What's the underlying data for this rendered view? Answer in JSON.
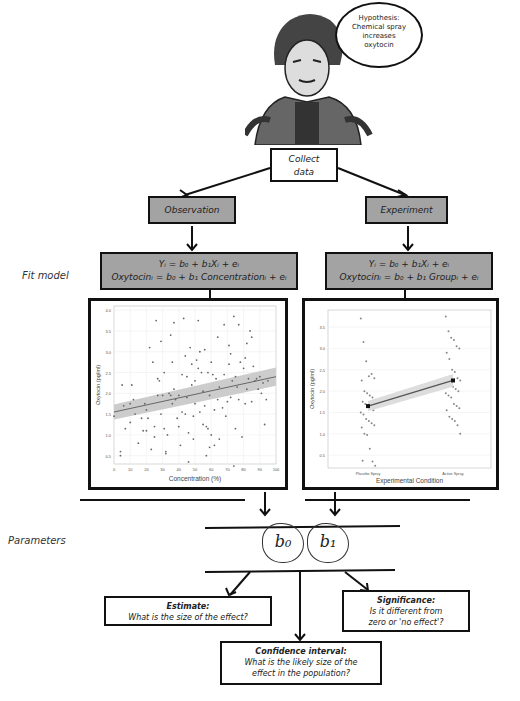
{
  "speech_bubble": {
    "lines": [
      "Hypothesis:",
      "Chemical spray",
      "increases",
      "oxytocin"
    ]
  },
  "collect_box": {
    "lines": [
      "Collect",
      "data"
    ]
  },
  "side_labels": {
    "fit_model": "Fit model",
    "parameters": "Parameters"
  },
  "branches": {
    "observation": {
      "label": "Observation",
      "eq1": "Yᵢ = b₀ + b₁Xᵢ + eᵢ",
      "eq2": "Oxytocinᵢ = b₀ + b₁ Concentrationᵢ + eᵢ"
    },
    "experiment": {
      "label": "Experiment",
      "eq1": "Yᵢ = b₀ + b₁Xᵢ + eᵢ",
      "eq2": "Oxytocinᵢ = b₀ + b₁ Groupᵢ + eᵢ"
    }
  },
  "parameters": {
    "b0": "b₀",
    "b1": "b₁"
  },
  "questions": {
    "estimate": {
      "title": "Estimate:",
      "text": "What is the size of the effect?"
    },
    "significance": {
      "title": "Significance:",
      "line1": "Is it different from",
      "line2": "zero or 'no effect'?"
    },
    "confidence": {
      "title": "Confidence interval:",
      "line1": "What is the likely size of the",
      "line2": "effect in the population?"
    }
  },
  "chart_data": [
    {
      "type": "scatter",
      "title": "",
      "xlabel": "Concentration (%)",
      "ylabel": "Oxytocin (pg/ml)",
      "xlim": [
        0,
        100
      ],
      "ylim": [
        0.3,
        4.1
      ],
      "xticks": [
        0,
        10,
        20,
        30,
        40,
        50,
        60,
        70,
        80,
        90,
        100
      ],
      "yticks": [
        0.5,
        1.0,
        1.5,
        2.0,
        2.5,
        3.0,
        3.5,
        4.0
      ],
      "grid": true,
      "regression": {
        "x": [
          0,
          100
        ],
        "y": [
          1.55,
          2.4
        ],
        "ci_band": true
      },
      "points": [
        [
          0,
          1.45
        ],
        [
          4,
          0.5
        ],
        [
          4,
          0.6
        ],
        [
          5,
          2.2
        ],
        [
          6,
          1.7
        ],
        [
          7,
          1.15
        ],
        [
          10,
          1.3
        ],
        [
          10,
          1.75
        ],
        [
          11,
          2.2
        ],
        [
          12,
          1.85
        ],
        [
          13,
          1.5
        ],
        [
          15,
          0.8
        ],
        [
          17,
          1.4
        ],
        [
          18,
          1.1
        ],
        [
          19,
          1.75
        ],
        [
          20,
          1.6
        ],
        [
          20,
          1.1
        ],
        [
          21,
          1.4
        ],
        [
          22,
          3.1
        ],
        [
          23,
          0.65
        ],
        [
          24,
          2.75
        ],
        [
          25,
          1.2
        ],
        [
          25,
          0.95
        ],
        [
          26,
          3.75
        ],
        [
          27,
          2.35
        ],
        [
          27,
          1.95
        ],
        [
          28,
          2.3
        ],
        [
          29,
          1.5
        ],
        [
          29,
          3.25
        ],
        [
          30,
          1.95
        ],
        [
          31,
          1.15
        ],
        [
          31,
          2.5
        ],
        [
          32,
          0.6
        ],
        [
          32,
          0.55
        ],
        [
          33,
          1.0
        ],
        [
          34,
          2.0
        ],
        [
          35,
          3.4
        ],
        [
          35,
          1.95
        ],
        [
          36,
          2.75
        ],
        [
          36,
          1.75
        ],
        [
          37,
          3.7
        ],
        [
          37,
          2.1
        ],
        [
          38,
          1.85
        ],
        [
          39,
          1.4
        ],
        [
          40,
          1.95
        ],
        [
          40,
          1.2
        ],
        [
          41,
          0.75
        ],
        [
          42,
          2.45
        ],
        [
          42,
          1.55
        ],
        [
          43,
          3.8
        ],
        [
          44,
          1.5
        ],
        [
          44,
          2.9
        ],
        [
          45,
          2.4
        ],
        [
          45,
          1.9
        ],
        [
          46,
          1.05
        ],
        [
          46,
          0.35
        ],
        [
          47,
          3.1
        ],
        [
          48,
          2.7
        ],
        [
          48,
          2.2
        ],
        [
          49,
          1.45
        ],
        [
          49,
          0.9
        ],
        [
          50,
          2.3
        ],
        [
          50,
          1.75
        ],
        [
          51,
          2.8
        ],
        [
          52,
          3.75
        ],
        [
          52,
          2.6
        ],
        [
          53,
          1.55
        ],
        [
          53,
          3.0
        ],
        [
          54,
          2.5
        ],
        [
          55,
          1.25
        ],
        [
          55,
          2.05
        ],
        [
          56,
          3.05
        ],
        [
          56,
          1.7
        ],
        [
          57,
          1.2
        ],
        [
          57,
          0.5
        ],
        [
          58,
          1.15
        ],
        [
          58,
          2.5
        ],
        [
          59,
          0.7
        ],
        [
          59,
          1.95
        ],
        [
          60,
          2.75
        ],
        [
          60,
          1.0
        ],
        [
          61,
          2.45
        ],
        [
          62,
          1.6
        ],
        [
          62,
          0.75
        ],
        [
          63,
          2.35
        ],
        [
          64,
          3.35
        ],
        [
          64,
          1.85
        ],
        [
          65,
          2.15
        ],
        [
          65,
          0.9
        ],
        [
          67,
          1.65
        ],
        [
          68,
          3.65
        ],
        [
          68,
          2.45
        ],
        [
          69,
          1.45
        ],
        [
          70,
          1.8
        ],
        [
          71,
          2.7
        ],
        [
          71,
          3.15
        ],
        [
          72,
          2.95
        ],
        [
          72,
          1.9
        ],
        [
          73,
          2.3
        ],
        [
          74,
          0.25
        ],
        [
          74,
          3.85
        ],
        [
          75,
          2.4
        ],
        [
          75,
          1.15
        ],
        [
          76,
          2.15
        ],
        [
          77,
          3.65
        ],
        [
          77,
          1.85
        ],
        [
          78,
          2.75
        ],
        [
          79,
          0.95
        ],
        [
          80,
          2.6
        ],
        [
          81,
          2.85
        ],
        [
          81,
          1.75
        ],
        [
          82,
          3.2
        ],
        [
          82,
          2.1
        ],
        [
          83,
          2.35
        ],
        [
          84,
          3.5
        ],
        [
          85,
          3.35
        ],
        [
          85,
          1.8
        ],
        [
          86,
          2.65
        ],
        [
          87,
          2.3
        ],
        [
          88,
          2.35
        ],
        [
          89,
          2.1
        ],
        [
          90,
          2.4
        ],
        [
          91,
          2.0
        ],
        [
          92,
          2.25
        ],
        [
          93,
          1.25
        ],
        [
          94,
          1.85
        ],
        [
          95,
          2.3
        ]
      ]
    },
    {
      "type": "scatter",
      "title": "",
      "xlabel": "Experimental Condition",
      "ylabel": "Oxytocin (pg/ml)",
      "categories": [
        "Placebo Spray",
        "Active Spray"
      ],
      "ylim": [
        0.2,
        3.9
      ],
      "yticks": [
        0.5,
        1.0,
        1.5,
        2.0,
        2.5,
        3.0,
        3.5
      ],
      "grid": true,
      "means": [
        1.65,
        2.25
      ],
      "points": {
        "Placebo Spray": [
          3.7,
          3.15,
          2.7,
          2.35,
          2.4,
          2.3,
          2.25,
          2.0,
          1.95,
          1.9,
          1.85,
          1.8,
          1.75,
          1.7,
          1.65,
          1.6,
          1.55,
          1.5,
          1.45,
          1.35,
          1.3,
          1.25,
          1.2,
          1.15,
          1.0,
          0.97,
          0.65,
          0.35,
          0.25,
          0.37
        ],
        "Active Spray": [
          3.75,
          3.4,
          3.25,
          3.2,
          3.05,
          3.0,
          2.9,
          2.75,
          2.5,
          2.45,
          2.3,
          2.25,
          2.2,
          2.15,
          2.1,
          2.05,
          2.0,
          1.95,
          1.9,
          1.85,
          1.7,
          1.65,
          1.6,
          1.55,
          1.4,
          1.35,
          1.3,
          1.2,
          1.0
        ]
      }
    }
  ]
}
